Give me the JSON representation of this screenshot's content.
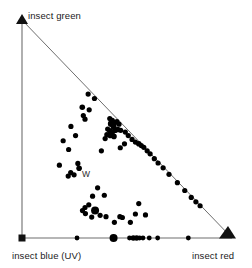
{
  "figure": {
    "title": "",
    "background_color": "#ffffff",
    "line_color": "#6e6e6e",
    "point_color": "#000000",
    "text_color": "#1a1a1a"
  },
  "labels": {
    "green_vertex": "insect green",
    "blue_vertex": "insect blue (UV)",
    "red_vertex": "insect red",
    "white_point": "W"
  },
  "chart_data": {
    "type": "scatter",
    "title": "",
    "xlabel": "",
    "ylabel": "",
    "projection": "triangular-chromaticity",
    "grid": false,
    "legend_position": "none",
    "axis_ranges": {
      "x": [
        0,
        1
      ],
      "y": [
        0,
        1
      ]
    },
    "triangle_vertices": [
      {
        "name": "insect blue (UV)",
        "x": 0.0,
        "y": 0.0,
        "marker": "square"
      },
      {
        "name": "insect red",
        "x": 1.0,
        "y": 0.0,
        "marker": "arrowhead-large"
      },
      {
        "name": "insect green",
        "x": 0.0,
        "y": 1.0,
        "marker": "arrowhead-small"
      }
    ],
    "annotations": [
      {
        "label": "W",
        "x": 0.3,
        "y": 0.295,
        "note": "white point"
      }
    ],
    "series": [
      {
        "name": "floral reflectance loci",
        "marker": "filled-circle",
        "color": "#000000",
        "points": [
          {
            "x": 0.315,
            "y": 0.66,
            "r": 2.6
          },
          {
            "x": 0.345,
            "y": 0.64,
            "r": 2.6
          },
          {
            "x": 0.287,
            "y": 0.6,
            "r": 2.8
          },
          {
            "x": 0.32,
            "y": 0.588,
            "r": 2.6
          },
          {
            "x": 0.292,
            "y": 0.562,
            "r": 2.6
          },
          {
            "x": 0.3,
            "y": 0.545,
            "r": 2.6
          },
          {
            "x": 0.233,
            "y": 0.512,
            "r": 2.6
          },
          {
            "x": 0.255,
            "y": 0.47,
            "r": 2.6
          },
          {
            "x": 0.418,
            "y": 0.548,
            "r": 2.6
          },
          {
            "x": 0.43,
            "y": 0.54,
            "r": 2.6
          },
          {
            "x": 0.424,
            "y": 0.524,
            "r": 3.2
          },
          {
            "x": 0.44,
            "y": 0.528,
            "r": 2.8
          },
          {
            "x": 0.452,
            "y": 0.534,
            "r": 2.6
          },
          {
            "x": 0.462,
            "y": 0.522,
            "r": 2.6
          },
          {
            "x": 0.436,
            "y": 0.51,
            "r": 3.0
          },
          {
            "x": 0.408,
            "y": 0.5,
            "r": 2.6
          },
          {
            "x": 0.418,
            "y": 0.492,
            "r": 2.8
          },
          {
            "x": 0.43,
            "y": 0.486,
            "r": 2.8
          },
          {
            "x": 0.444,
            "y": 0.494,
            "r": 2.8
          },
          {
            "x": 0.456,
            "y": 0.498,
            "r": 2.8
          },
          {
            "x": 0.47,
            "y": 0.494,
            "r": 2.6
          },
          {
            "x": 0.404,
            "y": 0.474,
            "r": 2.6
          },
          {
            "x": 0.42,
            "y": 0.47,
            "r": 2.8
          },
          {
            "x": 0.438,
            "y": 0.466,
            "r": 2.8
          },
          {
            "x": 0.396,
            "y": 0.456,
            "r": 2.6
          },
          {
            "x": 0.492,
            "y": 0.486,
            "r": 2.6
          },
          {
            "x": 0.506,
            "y": 0.47,
            "r": 2.6
          },
          {
            "x": 0.524,
            "y": 0.452,
            "r": 2.6
          },
          {
            "x": 0.54,
            "y": 0.44,
            "r": 2.6
          },
          {
            "x": 0.556,
            "y": 0.432,
            "r": 2.8
          },
          {
            "x": 0.568,
            "y": 0.424,
            "r": 2.6
          },
          {
            "x": 0.58,
            "y": 0.416,
            "r": 2.6
          },
          {
            "x": 0.596,
            "y": 0.4,
            "r": 2.6
          },
          {
            "x": 0.61,
            "y": 0.386,
            "r": 2.6
          },
          {
            "x": 0.63,
            "y": 0.364,
            "r": 2.6
          },
          {
            "x": 0.648,
            "y": 0.344,
            "r": 2.6
          },
          {
            "x": 0.672,
            "y": 0.322,
            "r": 2.6
          },
          {
            "x": 0.7,
            "y": 0.292,
            "r": 2.6
          },
          {
            "x": 0.74,
            "y": 0.254,
            "r": 2.6
          },
          {
            "x": 0.775,
            "y": 0.218,
            "r": 2.6
          },
          {
            "x": 0.806,
            "y": 0.186,
            "r": 2.6
          },
          {
            "x": 0.828,
            "y": 0.166,
            "r": 2.6
          },
          {
            "x": 0.848,
            "y": 0.148,
            "r": 2.6
          },
          {
            "x": 0.488,
            "y": 0.432,
            "r": 2.6
          },
          {
            "x": 0.468,
            "y": 0.414,
            "r": 2.6
          },
          {
            "x": 0.378,
            "y": 0.4,
            "r": 2.6
          },
          {
            "x": 0.196,
            "y": 0.446,
            "r": 2.6
          },
          {
            "x": 0.222,
            "y": 0.406,
            "r": 2.6
          },
          {
            "x": 0.178,
            "y": 0.334,
            "r": 2.6
          },
          {
            "x": 0.266,
            "y": 0.342,
            "r": 2.6
          },
          {
            "x": 0.272,
            "y": 0.32,
            "r": 2.8
          },
          {
            "x": 0.232,
            "y": 0.3,
            "r": 2.6
          },
          {
            "x": 0.248,
            "y": 0.29,
            "r": 2.6
          },
          {
            "x": 0.22,
            "y": 0.284,
            "r": 2.6
          },
          {
            "x": 0.36,
            "y": 0.23,
            "r": 2.6
          },
          {
            "x": 0.336,
            "y": 0.192,
            "r": 2.6
          },
          {
            "x": 0.392,
            "y": 0.196,
            "r": 2.6
          },
          {
            "x": 0.318,
            "y": 0.152,
            "r": 2.6
          },
          {
            "x": 0.3,
            "y": 0.14,
            "r": 2.6
          },
          {
            "x": 0.288,
            "y": 0.126,
            "r": 2.6
          },
          {
            "x": 0.302,
            "y": 0.112,
            "r": 2.6
          },
          {
            "x": 0.348,
            "y": 0.126,
            "r": 4.0
          },
          {
            "x": 0.332,
            "y": 0.096,
            "r": 2.6
          },
          {
            "x": 0.372,
            "y": 0.104,
            "r": 2.6
          },
          {
            "x": 0.4,
            "y": 0.098,
            "r": 2.6
          },
          {
            "x": 0.44,
            "y": 0.072,
            "r": 2.6
          },
          {
            "x": 0.466,
            "y": 0.098,
            "r": 2.6
          },
          {
            "x": 0.478,
            "y": 0.094,
            "r": 2.6
          },
          {
            "x": 0.516,
            "y": 0.072,
            "r": 2.6
          },
          {
            "x": 0.54,
            "y": 0.11,
            "r": 2.6
          },
          {
            "x": 0.556,
            "y": 0.158,
            "r": 2.6
          },
          {
            "x": 0.588,
            "y": 0.106,
            "r": 2.6
          },
          {
            "x": 0.262,
            "y": 0.0,
            "r": 2.4
          },
          {
            "x": 0.436,
            "y": 0.0,
            "r": 4.0
          },
          {
            "x": 0.512,
            "y": 0.0,
            "r": 2.4
          },
          {
            "x": 0.53,
            "y": 0.0,
            "r": 2.8
          },
          {
            "x": 0.546,
            "y": 0.0,
            "r": 2.8
          },
          {
            "x": 0.56,
            "y": 0.0,
            "r": 2.4
          },
          {
            "x": 0.576,
            "y": 0.0,
            "r": 2.4
          },
          {
            "x": 0.606,
            "y": 0.0,
            "r": 2.4
          },
          {
            "x": 0.646,
            "y": 0.0,
            "r": 2.4
          },
          {
            "x": 0.792,
            "y": 0.0,
            "r": 2.4
          }
        ]
      }
    ]
  }
}
